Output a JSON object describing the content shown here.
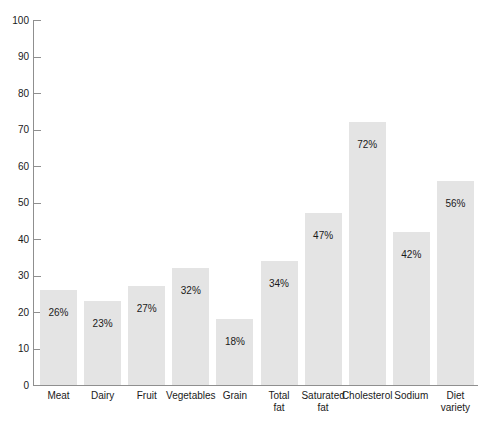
{
  "chart_data": {
    "type": "bar",
    "title": "",
    "subtitle": "",
    "xlabel": "",
    "ylabel": "",
    "ylim": [
      0,
      100
    ],
    "y_ticks": [
      0,
      10,
      20,
      30,
      40,
      50,
      60,
      70,
      80,
      90,
      100
    ],
    "grid": false,
    "legend": "none",
    "value_label_suffix": "%",
    "bar_color": "#e4e4e4",
    "axis_color": "#8f8f8f",
    "text_color": "#1a1a1a",
    "categories": [
      "Meat",
      "Dairy",
      "Fruit",
      "Vegetables",
      "Grain",
      "Total fat",
      "Saturated fat",
      "Cholesterol",
      "Sodium",
      "Diet variety"
    ],
    "category_lines": [
      [
        "Meat"
      ],
      [
        "Dairy"
      ],
      [
        "Fruit"
      ],
      [
        "Vegetables"
      ],
      [
        "Grain"
      ],
      [
        "Total",
        "fat"
      ],
      [
        "Saturated",
        "fat"
      ],
      [
        "Cholesterol"
      ],
      [
        "Sodium"
      ],
      [
        "Diet",
        "variety"
      ]
    ],
    "values": [
      26,
      23,
      27,
      32,
      18,
      34,
      47,
      72,
      42,
      56
    ],
    "value_labels": [
      "26%",
      "23%",
      "27%",
      "32%",
      "18%",
      "34%",
      "47%",
      "72%",
      "42%",
      "56%"
    ]
  },
  "axis": {
    "y_tick_labels": [
      "0",
      "10",
      "20",
      "30",
      "40",
      "50",
      "60",
      "70",
      "80",
      "90",
      "100"
    ]
  }
}
